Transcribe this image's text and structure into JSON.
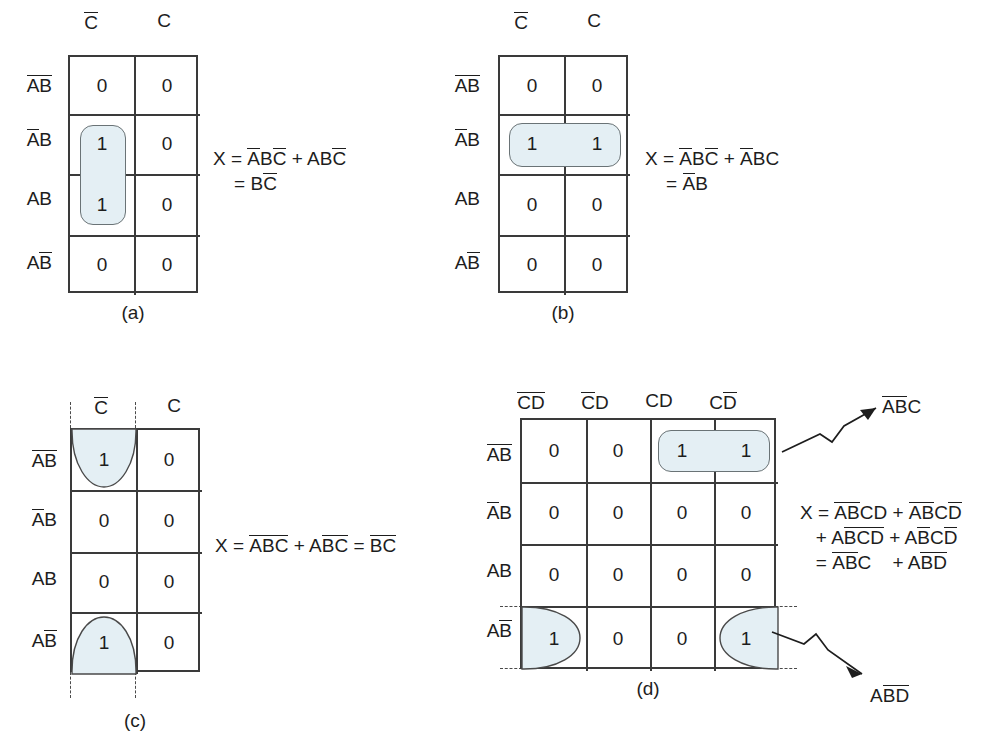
{
  "figure": {
    "panels": [
      {
        "id": "a",
        "caption": "(a)",
        "col_headers": [
          "C̅",
          "C"
        ],
        "row_headers": [
          "A̅B̅",
          "A̅B",
          "AB",
          "AB̅"
        ],
        "cells": [
          [
            "0",
            "0"
          ],
          [
            "1",
            "0"
          ],
          [
            "1",
            "0"
          ],
          [
            "0",
            "0"
          ]
        ],
        "equation_lines": [
          "X = A̅BC̅ + ABC̅",
          "   = BC̅"
        ],
        "group_type": "vertical-pair-rounded",
        "grouped_cells": [
          [
            1,
            0
          ],
          [
            2,
            0
          ]
        ]
      },
      {
        "id": "b",
        "caption": "(b)",
        "col_headers": [
          "C̅",
          "C"
        ],
        "row_headers": [
          "A̅B̅",
          "A̅B",
          "AB",
          "AB̅"
        ],
        "cells": [
          [
            "0",
            "0"
          ],
          [
            "1",
            "1"
          ],
          [
            "0",
            "0"
          ],
          [
            "0",
            "0"
          ]
        ],
        "equation_lines": [
          "X = A̅BC̅ + A̅BC",
          "   = A̅B"
        ],
        "group_type": "horizontal-pair-rounded",
        "grouped_cells": [
          [
            1,
            0
          ],
          [
            1,
            1
          ]
        ]
      },
      {
        "id": "c",
        "caption": "(c)",
        "col_headers": [
          "C̅",
          "C"
        ],
        "row_headers": [
          "A̅B̅",
          "A̅B",
          "AB",
          "AB̅"
        ],
        "cells": [
          [
            "1",
            "0"
          ],
          [
            "0",
            "0"
          ],
          [
            "0",
            "0"
          ],
          [
            "1",
            "0"
          ]
        ],
        "equation_lines": [
          "X = A̅B̅C̅ + AB̅C̅ = B̅C̅"
        ],
        "group_type": "vertical-wrap-halfellipse",
        "grouped_cells": [
          [
            0,
            0
          ],
          [
            3,
            0
          ]
        ],
        "wrap_dashes": true
      },
      {
        "id": "d",
        "caption": "(d)",
        "col_headers": [
          "C̅D̅",
          "C̅D",
          "CD",
          "CD̅"
        ],
        "row_headers": [
          "A̅B̅",
          "A̅B",
          "AB",
          "AB̅"
        ],
        "cells": [
          [
            "0",
            "0",
            "1",
            "1"
          ],
          [
            "0",
            "0",
            "0",
            "0"
          ],
          [
            "0",
            "0",
            "0",
            "0"
          ],
          [
            "1",
            "0",
            "0",
            "1"
          ]
        ],
        "equation_lines": [
          "X = A̅B̅CD + A̅B̅CD̅",
          "   + AB̅C̅D̅ + AB̅CD̅",
          "   = A̅B̅C    + AB̅D̅"
        ],
        "annotations": [
          {
            "name": "group-label-top",
            "text": "A̅B̅C"
          },
          {
            "name": "group-label-bottom",
            "text": "AB̅D̅"
          }
        ],
        "group_type": "mixed",
        "grouped_cells_rounded": [
          [
            0,
            2
          ],
          [
            0,
            3
          ]
        ],
        "grouped_cells_wrap": [
          [
            3,
            0
          ],
          [
            3,
            3
          ]
        ],
        "wrap_dashes": true
      }
    ],
    "colors": {
      "highlight_fill": "#e4eff4",
      "grid_line": "#3a3a3a",
      "group_outline": "#6a7376",
      "text": "#1d1d1d",
      "background": "#ffffff"
    }
  }
}
